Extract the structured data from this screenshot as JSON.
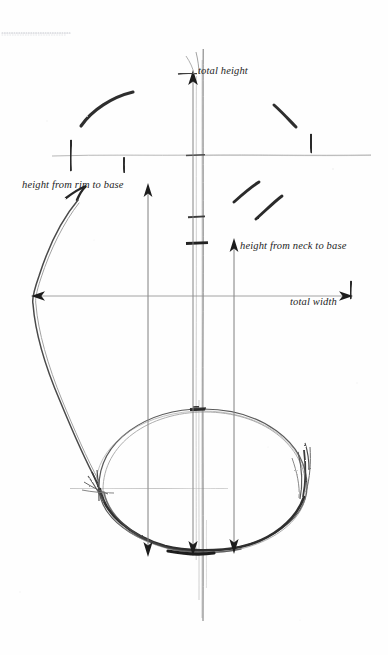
{
  "figure": {
    "kind": "hand-drawn ceramic vessel measurement diagram",
    "background_color": "#fefefe",
    "ink_color": "#2b2b2b",
    "guide_line_color": "#9a9a9a",
    "faint_line_color": "#b9b9b9",
    "dotted_rule_color": "#b9bcc4",
    "width": 388,
    "height": 655
  },
  "labels": {
    "total_height": "total height",
    "height_from_rim_to_base": "height from rim to base",
    "height_from_neck_to_base": "height from neck to base",
    "total_width": "total width"
  },
  "measurements": [
    {
      "id": "total-height",
      "label": "total height",
      "orientation": "vertical",
      "arrow": "up",
      "arrow_tip": {
        "x": 193,
        "y": 73
      },
      "baseline": {
        "x": 193,
        "y": 556
      }
    },
    {
      "id": "height-from-rim-to-base",
      "label": "height from rim to base",
      "orientation": "vertical",
      "arrow": "up",
      "arrow_tip": {
        "x": 148,
        "y": 186
      },
      "baseline": {
        "x": 148,
        "y": 553
      }
    },
    {
      "id": "height-from-neck-to-base",
      "label": "height from neck to base",
      "orientation": "vertical",
      "arrow": "up",
      "arrow_tip": {
        "x": 234,
        "y": 240
      },
      "baseline": {
        "x": 234,
        "y": 551
      }
    },
    {
      "id": "total-width",
      "label": "total width",
      "orientation": "horizontal",
      "arrow": "both",
      "left_tip": {
        "x": 33,
        "y": 296
      },
      "right_tip": {
        "x": 352,
        "y": 296
      }
    }
  ],
  "guides": {
    "central_axis": {
      "x": 203,
      "y_top": 49,
      "y_bottom": 621
    },
    "inner_axis": {
      "x": 196,
      "y_top": 76,
      "y_bottom": 560
    },
    "rim_line": {
      "y": 155,
      "x_start": 52,
      "x_end": 371
    },
    "base_line": {
      "y": 488,
      "x_start": 70,
      "x_end": 228
    },
    "dotted_rule": {
      "y": 33,
      "x_start": 2,
      "x_end": 70
    }
  },
  "axis_ticks": [
    {
      "x": 203,
      "y": 155,
      "w": 9
    },
    {
      "x": 196,
      "y": 217,
      "w": 13
    },
    {
      "x": 196,
      "y": 243,
      "w": 16
    }
  ],
  "bottom_arrowheads": [
    {
      "x": 148,
      "y": 553
    },
    {
      "x": 193,
      "y": 551
    },
    {
      "x": 234,
      "y": 551
    }
  ]
}
